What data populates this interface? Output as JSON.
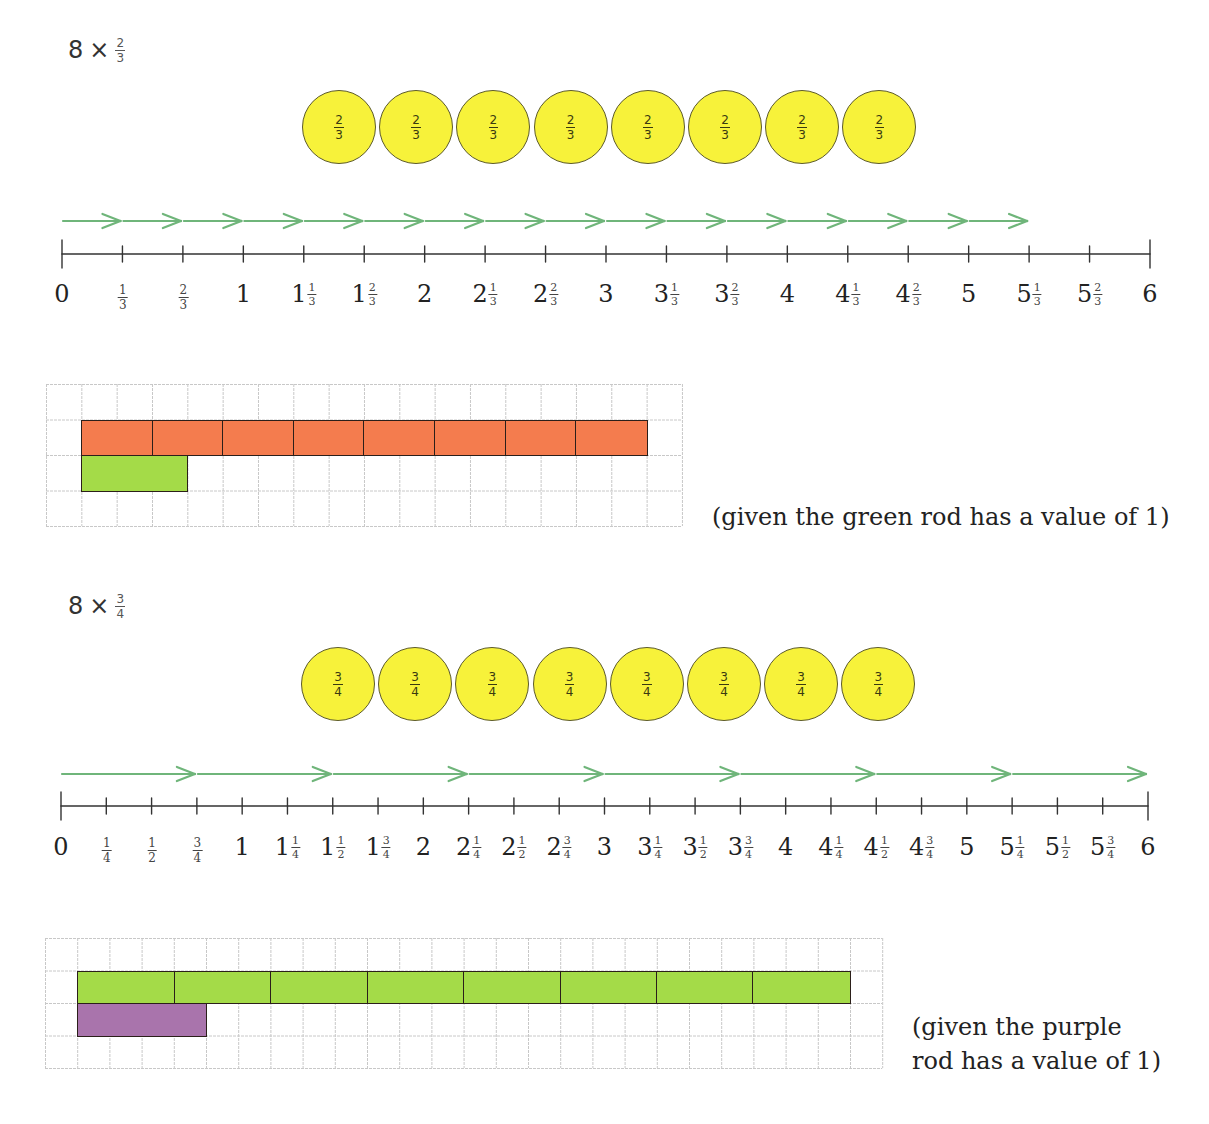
{
  "colors": {
    "counter_fill": "#f7f23a",
    "arrow": "#6fb57a",
    "orange_rod": "#f47c4e",
    "green_rod": "#a4db48",
    "purple_rod": "#a974ac",
    "grid_line": "#c8c8c8"
  },
  "sections": [
    {
      "expression": {
        "whole": "8",
        "operator": "×",
        "numerator": "2",
        "denominator": "3"
      },
      "counters": {
        "count": 8,
        "label": {
          "numerator": "2",
          "denominator": "3"
        },
        "items": [
          {
            "numerator": "2",
            "denominator": "3"
          },
          {
            "numerator": "2",
            "denominator": "3"
          },
          {
            "numerator": "2",
            "denominator": "3"
          },
          {
            "numerator": "2",
            "denominator": "3"
          },
          {
            "numerator": "2",
            "denominator": "3"
          },
          {
            "numerator": "2",
            "denominator": "3"
          },
          {
            "numerator": "2",
            "denominator": "3"
          },
          {
            "numerator": "2",
            "denominator": "3"
          }
        ]
      },
      "number_line": {
        "min": 0,
        "max": 6,
        "step_denominator": 3,
        "labels": [
          {
            "whole": "0"
          },
          {
            "num": "1",
            "den": "3"
          },
          {
            "num": "2",
            "den": "3"
          },
          {
            "whole": "1"
          },
          {
            "whole": "1",
            "num": "1",
            "den": "3"
          },
          {
            "whole": "1",
            "num": "2",
            "den": "3"
          },
          {
            "whole": "2"
          },
          {
            "whole": "2",
            "num": "1",
            "den": "3"
          },
          {
            "whole": "2",
            "num": "2",
            "den": "3"
          },
          {
            "whole": "3"
          },
          {
            "whole": "3",
            "num": "1",
            "den": "3"
          },
          {
            "whole": "3",
            "num": "2",
            "den": "3"
          },
          {
            "whole": "4"
          },
          {
            "whole": "4",
            "num": "1",
            "den": "3"
          },
          {
            "whole": "4",
            "num": "2",
            "den": "3"
          },
          {
            "whole": "5"
          },
          {
            "whole": "5",
            "num": "1",
            "den": "3"
          },
          {
            "whole": "5",
            "num": "2",
            "den": "3"
          },
          {
            "whole": "6"
          }
        ],
        "jumps": {
          "count": 16,
          "jump_size_ticks": 1,
          "end_label": "5 1/3"
        }
      },
      "rods": {
        "grid": {
          "cols": 18,
          "rows": 4
        },
        "top_rod": {
          "color_name": "orange",
          "segments": 8,
          "cols_per_segment": 2,
          "start_col": 1,
          "row": 1
        },
        "unit_rod": {
          "color_name": "green",
          "cols": 3,
          "start_col": 1,
          "row": 2
        },
        "note": "(given the green rod has a value of 1)"
      }
    },
    {
      "expression": {
        "whole": "8",
        "operator": "×",
        "numerator": "3",
        "denominator": "4"
      },
      "counters": {
        "count": 8,
        "label": {
          "numerator": "3",
          "denominator": "4"
        },
        "items": [
          {
            "numerator": "3",
            "denominator": "4"
          },
          {
            "numerator": "3",
            "denominator": "4"
          },
          {
            "numerator": "3",
            "denominator": "4"
          },
          {
            "numerator": "3",
            "denominator": "4"
          },
          {
            "numerator": "3",
            "denominator": "4"
          },
          {
            "numerator": "3",
            "denominator": "4"
          },
          {
            "numerator": "3",
            "denominator": "4"
          },
          {
            "numerator": "3",
            "denominator": "4"
          }
        ]
      },
      "number_line": {
        "min": 0,
        "max": 6,
        "step_denominator": 4,
        "labels": [
          {
            "whole": "0"
          },
          {
            "num": "1",
            "den": "4"
          },
          {
            "num": "1",
            "den": "2"
          },
          {
            "num": "3",
            "den": "4"
          },
          {
            "whole": "1"
          },
          {
            "whole": "1",
            "num": "1",
            "den": "4"
          },
          {
            "whole": "1",
            "num": "1",
            "den": "2"
          },
          {
            "whole": "1",
            "num": "3",
            "den": "4"
          },
          {
            "whole": "2"
          },
          {
            "whole": "2",
            "num": "1",
            "den": "4"
          },
          {
            "whole": "2",
            "num": "1",
            "den": "2"
          },
          {
            "whole": "2",
            "num": "3",
            "den": "4"
          },
          {
            "whole": "3"
          },
          {
            "whole": "3",
            "num": "1",
            "den": "4"
          },
          {
            "whole": "3",
            "num": "1",
            "den": "2"
          },
          {
            "whole": "3",
            "num": "3",
            "den": "4"
          },
          {
            "whole": "4"
          },
          {
            "whole": "4",
            "num": "1",
            "den": "4"
          },
          {
            "whole": "4",
            "num": "1",
            "den": "2"
          },
          {
            "whole": "4",
            "num": "3",
            "den": "4"
          },
          {
            "whole": "5"
          },
          {
            "whole": "5",
            "num": "1",
            "den": "4"
          },
          {
            "whole": "5",
            "num": "1",
            "den": "2"
          },
          {
            "whole": "5",
            "num": "3",
            "den": "4"
          },
          {
            "whole": "6"
          }
        ],
        "jumps": {
          "count": 8,
          "jump_size_ticks": 3,
          "end_label": "6"
        }
      },
      "rods": {
        "grid": {
          "cols": 26,
          "rows": 4
        },
        "top_rod": {
          "color_name": "green",
          "segments": 8,
          "cols_per_segment": 3,
          "start_col": 1,
          "row": 1
        },
        "unit_rod": {
          "color_name": "purple",
          "cols": 4,
          "start_col": 1,
          "row": 2
        },
        "note_lines": [
          "(given the purple",
          "rod has a value of 1)"
        ]
      }
    }
  ]
}
